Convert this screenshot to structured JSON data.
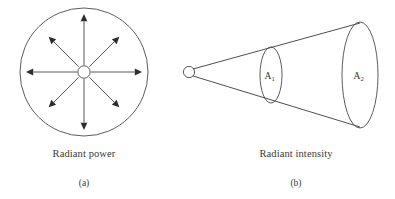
{
  "figure": {
    "panels": [
      {
        "id": "a",
        "tag": "(a)",
        "caption": "Radiant power",
        "kind": "radiating-sphere",
        "outer_circle": {
          "cx": 84,
          "cy": 72,
          "r": 64
        },
        "source_circle": {
          "cx": 84,
          "cy": 72,
          "r": 6.2
        },
        "arrow_count": 8,
        "arrow_directions_deg": [
          0,
          45,
          90,
          135,
          180,
          225,
          270,
          315
        ],
        "arrow_reach_cardinal": 58,
        "arrow_reach_diagonal": 50
      },
      {
        "id": "b",
        "tag": "(b)",
        "caption": "Radiant intensity",
        "kind": "cone-with-cross-sections",
        "apex_circle": {
          "cx": 189,
          "cy": 72,
          "r": 5.6
        },
        "cone_top_edge": {
          "x1": 193,
          "y1": 69,
          "x2": 360,
          "y2": 23
        },
        "cone_bottom_edge": {
          "x1": 193,
          "y1": 76,
          "x2": 360,
          "y2": 127
        },
        "cross_sections": [
          {
            "label": "A",
            "subscript": "1",
            "cx": 271,
            "cy": 75,
            "rx": 11,
            "ry": 28
          },
          {
            "label": "A",
            "subscript": "2",
            "cx": 360,
            "cy": 75,
            "rx": 18,
            "ry": 53
          }
        ]
      }
    ]
  },
  "colors": {
    "background": "#ffffff",
    "line": "#3a3a3a",
    "arrow": "#2e2e2e",
    "text": "#3a3a3a"
  }
}
